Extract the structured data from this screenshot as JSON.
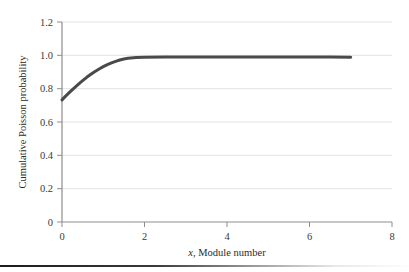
{
  "figure": {
    "background_color": "#ffffff",
    "rule_color": "#1c1c1c"
  },
  "chart_data": {
    "type": "line",
    "title": "",
    "subtitle": "",
    "xlabel": "x, Module number",
    "xlabel_italic_part": "x",
    "xlabel_rest": ", Module number",
    "ylabel": "Cumulative Poisson probability",
    "xlim": [
      0,
      8
    ],
    "ylim": [
      0,
      1.2
    ],
    "xticks": [
      0,
      2,
      4,
      6,
      8
    ],
    "xtick_labels": [
      "0",
      "2",
      "4",
      "6",
      "8"
    ],
    "yticks": [
      0,
      0.2,
      0.4,
      0.6,
      0.8,
      1.0,
      1.2
    ],
    "ytick_labels": [
      "0",
      "0.2",
      "0.4",
      "0.6",
      "0.8",
      "1.0",
      "1.2"
    ],
    "grid": "horizontal",
    "grid_color": "#e3e3e3",
    "axis_color": "#8d8d8d",
    "legend": "none",
    "legend_position": "none",
    "series": [
      {
        "name": "Cumulative Poisson probability",
        "color": "#4a4a4a",
        "line_width": 3,
        "x": [
          0.0,
          0.1,
          0.2,
          0.3,
          0.4,
          0.5,
          0.6,
          0.7,
          0.8,
          0.9,
          1.0,
          1.1,
          1.2,
          1.3,
          1.4,
          1.5,
          1.6,
          1.8,
          2.0,
          2.5,
          3.0,
          3.5,
          4.0,
          4.5,
          5.0,
          5.5,
          6.0,
          6.5,
          7.0
        ],
        "values": [
          0.733,
          0.758,
          0.782,
          0.805,
          0.827,
          0.848,
          0.868,
          0.886,
          0.903,
          0.918,
          0.932,
          0.944,
          0.955,
          0.964,
          0.972,
          0.978,
          0.982,
          0.987,
          0.989,
          0.99,
          0.99,
          0.99,
          0.99,
          0.99,
          0.99,
          0.99,
          0.99,
          0.99,
          0.988
        ]
      }
    ]
  }
}
